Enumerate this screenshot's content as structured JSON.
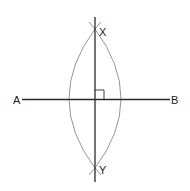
{
  "diagram": {
    "labels": {
      "A": "A",
      "B": "B",
      "X": "X",
      "Y": "Y"
    },
    "colors": {
      "line": "#2a2a2a",
      "arc": "#6a6a6a",
      "text": "#222222",
      "background": "#ffffff"
    },
    "segment_AB": {
      "x1": 22,
      "y1": 99.5,
      "x2": 170,
      "y2": 99.5
    },
    "bisector_XY": {
      "x1": 95,
      "y1": 17,
      "x2": 95,
      "y2": 182
    },
    "point_X": {
      "x": 95,
      "y": 29
    },
    "point_Y": {
      "x": 95,
      "y": 168
    },
    "right_angle_marker": {
      "x": 95,
      "y": 90,
      "size": 9
    }
  }
}
